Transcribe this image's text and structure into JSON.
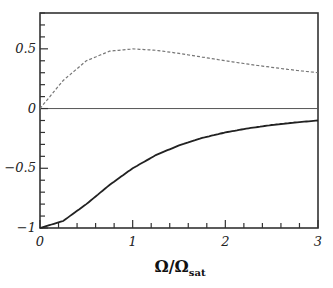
{
  "chart_data": {
    "type": "line",
    "title": "",
    "xlabel": "Ω/Ω_sat",
    "xlabel_main": "Ω/Ω",
    "xlabel_sub": "sat",
    "ylabel": "",
    "xlim": [
      0,
      3
    ],
    "ylim": [
      -1,
      0.8
    ],
    "xticks": [
      0,
      1,
      2,
      3
    ],
    "xtick_labels": [
      "0",
      "1",
      "2",
      "3"
    ],
    "yticks": [
      -1,
      -0.5,
      0,
      0.5
    ],
    "ytick_labels": [
      "−1",
      "−0.5",
      "0",
      "0.5"
    ],
    "grid": false,
    "legend": null,
    "reference_line": {
      "y": 0,
      "style": "solid-thin"
    },
    "x": [
      0,
      0.25,
      0.5,
      0.75,
      1,
      1.25,
      1.5,
      1.75,
      2,
      2.25,
      2.5,
      2.75,
      3
    ],
    "series": [
      {
        "name": "solid",
        "style": "solid",
        "color": "#222222",
        "values": [
          -1.0,
          -0.941,
          -0.8,
          -0.64,
          -0.5,
          -0.39,
          -0.308,
          -0.246,
          -0.2,
          -0.165,
          -0.138,
          -0.117,
          -0.1
        ]
      },
      {
        "name": "dashed",
        "style": "dashed",
        "color": "#777777",
        "values": [
          0.0,
          0.235,
          0.4,
          0.48,
          0.5,
          0.488,
          0.462,
          0.431,
          0.4,
          0.371,
          0.345,
          0.321,
          0.3
        ]
      }
    ]
  }
}
